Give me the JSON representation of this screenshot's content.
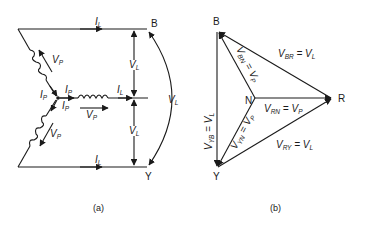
{
  "figure_a": {
    "caption": "(a)",
    "nodes": {
      "B": "B",
      "Y": "Y"
    },
    "labels": {
      "il_top": {
        "main": "I",
        "sub": "L"
      },
      "il_mid": {
        "main": "I",
        "sub": "L"
      },
      "il_bot": {
        "main": "I",
        "sub": "L"
      },
      "vp_upper": {
        "main": "V",
        "sub": "P"
      },
      "vp_mid": {
        "main": "V",
        "sub": "P"
      },
      "vp_lower": {
        "main": "V",
        "sub": "P"
      },
      "ip_left": {
        "main": "I",
        "sub": "P"
      },
      "ip_right_top": {
        "main": "I",
        "sub": "P"
      },
      "ip_right_bot": {
        "main": "I",
        "sub": "P"
      },
      "vl_upper": {
        "main": "V",
        "sub": "L"
      },
      "vl_lower": {
        "main": "V",
        "sub": "L"
      },
      "vl_arc": {
        "main": "V",
        "sub": "L"
      }
    }
  },
  "figure_b": {
    "caption": "(b)",
    "nodes": {
      "B": "B",
      "N": "N",
      "R": "R",
      "Y": "Y"
    },
    "labels": {
      "vbr": {
        "main": "V",
        "sub": "BR",
        "eq": " = V",
        "eqsub": "L"
      },
      "vbn": {
        "main": "V",
        "sub": "BN",
        "eq": " = V",
        "eqsub": "P"
      },
      "vrn": {
        "main": "V",
        "sub": "RN",
        "eq": " = V",
        "eqsub": "P"
      },
      "vyb": {
        "main": "V",
        "sub": "YB",
        "eq": " = V",
        "eqsub": "L"
      },
      "vyn": {
        "main": "V",
        "sub": "YN",
        "eq": " = V",
        "eqsub": "P"
      },
      "vry": {
        "main": "V",
        "sub": "RY",
        "eq": " = V",
        "eqsub": "L"
      }
    }
  },
  "colors": {
    "line": "#1a1a1a",
    "background": "#ffffff"
  }
}
